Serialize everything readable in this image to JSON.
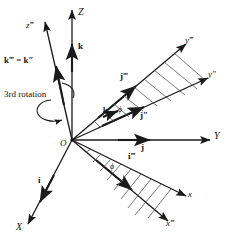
{
  "figure": {
    "background_color": "#ffffff",
    "stroke_color": "#1a1a1a",
    "hatch_color": "#555555",
    "caption": "3rd rotation"
  },
  "axes": [
    {
      "id": "Z",
      "label": "Z",
      "style": "italic",
      "desc": "vertical up axis"
    },
    {
      "id": "zppp",
      "label": "z‴",
      "style": "italic",
      "desc": "tilted up-left rotated axis"
    },
    {
      "id": "Y",
      "label": "Y",
      "style": "italic",
      "desc": "horizontal right axis"
    },
    {
      "id": "yppp",
      "label": "y‴",
      "style": "italic",
      "desc": "upper right rotated axis"
    },
    {
      "id": "ypp",
      "label": "y″",
      "style": "italic",
      "desc": "upper right second rotated axis"
    },
    {
      "id": "X",
      "label": "X",
      "style": "italic",
      "desc": "lower left axis"
    },
    {
      "id": "x",
      "label": "x",
      "style": "italic",
      "desc": "lower right axis"
    },
    {
      "id": "xppp",
      "label": "x‴",
      "style": "italic",
      "desc": "lower right rotated axis"
    }
  ],
  "vectors": [
    {
      "id": "k",
      "label": "k",
      "desc": "unit vector along Z"
    },
    {
      "id": "kppp",
      "label": "k‴ = k″",
      "desc": "unit vector along z-triple-prime equals k-double-prime"
    },
    {
      "id": "j",
      "label": "j",
      "desc": "unit vector along Y"
    },
    {
      "id": "jppp",
      "label": "j‴",
      "desc": "unit vector along y-triple-prime"
    },
    {
      "id": "jpp",
      "label": "j″",
      "desc": "unit vector along y-double-prime"
    },
    {
      "id": "i",
      "label": "i",
      "desc": "unit vector along X"
    },
    {
      "id": "ippp",
      "label": "i‴",
      "desc": "unit vector along x-triple-prime"
    },
    {
      "id": "kphi",
      "label": "k",
      "desc": "small k near upper phi angle"
    }
  ],
  "angles": [
    {
      "id": "phi-upper",
      "label": "ϕ",
      "desc": "rotation angle phi between y-double-prime and y-triple-prime"
    },
    {
      "id": "phi-lower",
      "label": "ϕ",
      "desc": "rotation angle phi between x and x-triple-prime"
    }
  ],
  "points": [
    {
      "id": "origin",
      "label": "O",
      "desc": "origin of coordinate system"
    }
  ],
  "annotations": [
    {
      "id": "rotation-caption",
      "label": "3rd rotation",
      "desc": "text label for the third rotation"
    }
  ]
}
